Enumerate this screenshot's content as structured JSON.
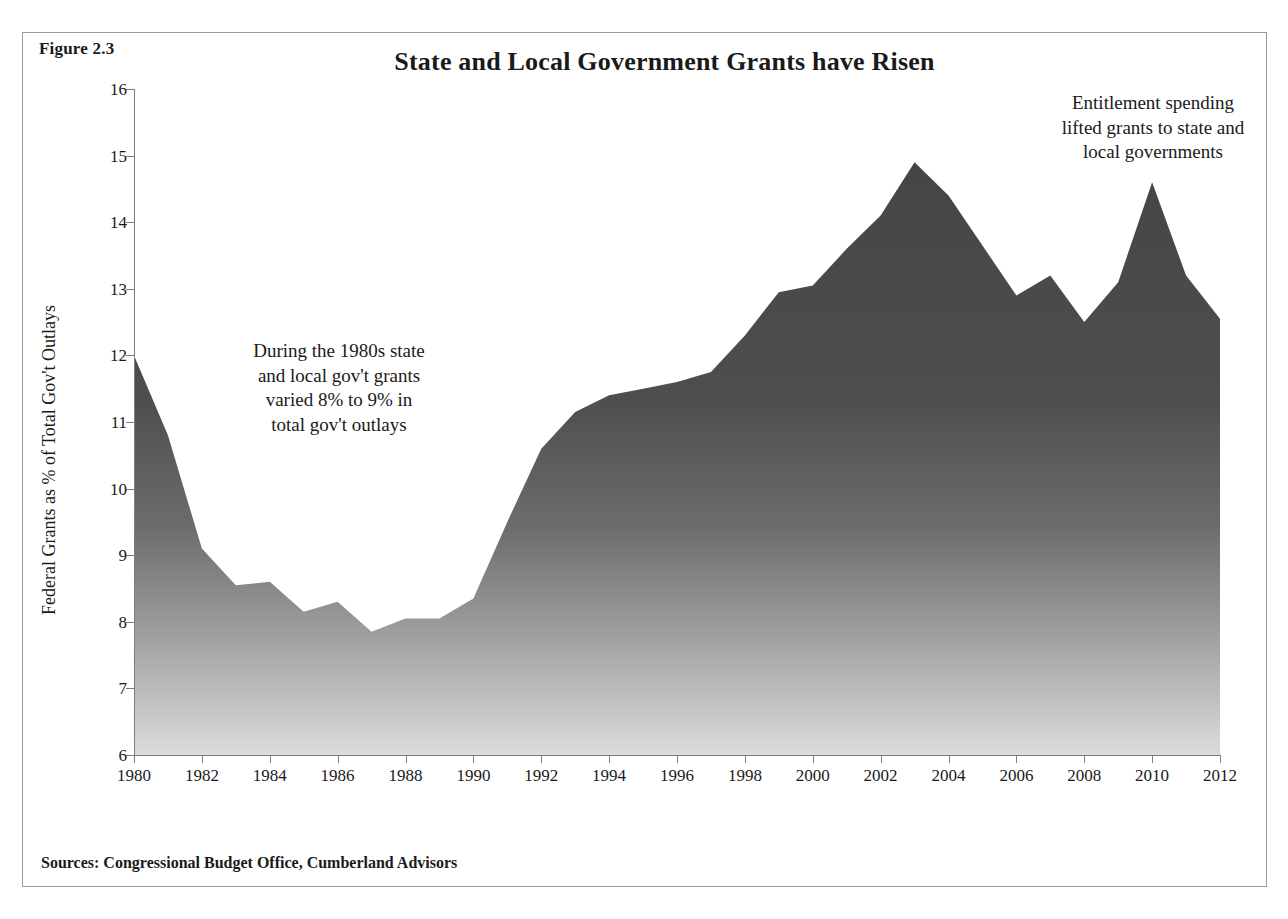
{
  "figure": {
    "label": "Figure 2.3",
    "title": "State and Local Government Grants have Risen",
    "sources": "Sources: Congressional Budget Office, Cumberland Advisors"
  },
  "annotations": {
    "left": "During the 1980s state\nand local gov't grants\nvaried 8% to 9% in\ntotal gov't outlays",
    "right": "Entitlement spending\nlifted grants to state and\nlocal governments"
  },
  "colors": {
    "area_top": "#4a4a4a",
    "area_bottom": "#d2d2d2",
    "axis": "#7d7d7d",
    "frame": "#9a9a9a",
    "text": "#1a1a1a"
  },
  "chart_data": {
    "type": "area",
    "title": "State and Local Government Grants have Risen",
    "xlabel": "",
    "ylabel": "Federal Grants as % of Total Gov't Outlays",
    "xlim": [
      1980,
      2012
    ],
    "ylim": [
      6,
      16
    ],
    "ytick_labels": [
      "16",
      "15",
      "14",
      "13",
      "12",
      "11",
      "10",
      "9",
      "8",
      "7",
      "6"
    ],
    "yticks": [
      16,
      15,
      14,
      13,
      12,
      11,
      10,
      9,
      8,
      7,
      6
    ],
    "xtick_labels": [
      "1980",
      "1982",
      "1984",
      "1986",
      "1988",
      "1990",
      "1992",
      "1994",
      "1996",
      "1998",
      "2000",
      "2002",
      "2004",
      "2006",
      "2008",
      "2010",
      "2012"
    ],
    "xticks": [
      1980,
      1982,
      1984,
      1986,
      1988,
      1990,
      1992,
      1994,
      1996,
      1998,
      2000,
      2002,
      2004,
      2006,
      2008,
      2010,
      2012
    ],
    "grid": false,
    "legend": false,
    "x": [
      1980,
      1981,
      1982,
      1983,
      1984,
      1985,
      1986,
      1987,
      1988,
      1989,
      1990,
      1991,
      1992,
      1993,
      1994,
      1995,
      1996,
      1997,
      1998,
      1999,
      2000,
      2001,
      2002,
      2003,
      2004,
      2005,
      2006,
      2007,
      2008,
      2009,
      2010,
      2011,
      2012
    ],
    "values": [
      12.0,
      10.8,
      9.1,
      8.55,
      8.6,
      8.15,
      8.3,
      7.85,
      8.05,
      8.05,
      8.35,
      9.5,
      10.6,
      11.15,
      11.4,
      11.5,
      11.6,
      11.75,
      12.3,
      12.95,
      13.05,
      13.6,
      14.1,
      14.9,
      14.4,
      13.65,
      12.9,
      13.2,
      12.5,
      13.1,
      14.6,
      13.2,
      12.55
    ],
    "annotations": [
      {
        "name": "left",
        "text": "During the 1980s state and local gov't grants varied 8% to 9% in total gov't outlays"
      },
      {
        "name": "right",
        "text": "Entitlement spending lifted grants to state and local governments"
      }
    ]
  }
}
